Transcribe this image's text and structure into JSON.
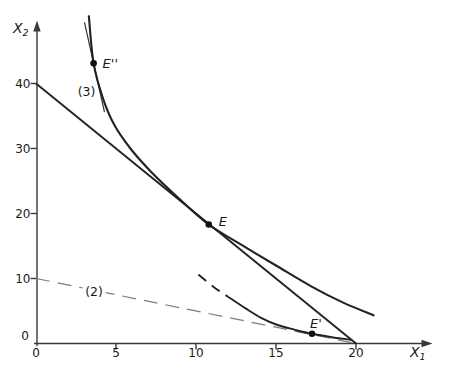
{
  "chart_data": {
    "type": "line",
    "title": "",
    "xlabel": {
      "base": "X",
      "sub": "1"
    },
    "ylabel": {
      "base": "X",
      "sub": "2"
    },
    "xlim": [
      0,
      24.5
    ],
    "ylim": [
      0,
      50.5
    ],
    "grid": false,
    "legend": "none",
    "x_ticks": [
      0,
      5,
      10,
      15,
      20
    ],
    "y_ticks": [
      0,
      10,
      20,
      30,
      40
    ],
    "style": {
      "background": "#ffffff",
      "axis_color": "#3a3a3a",
      "text_color": "#1a1a1a",
      "curve_color": "#222222",
      "tangent_color": "#333333",
      "dashed_line_color": "#7d7d7d",
      "point_color": "#111111"
    },
    "series": [
      {
        "name": "budget-line-1",
        "role": "price line tangent at E",
        "shape": "line",
        "dash": null,
        "width": 1.9,
        "color": "#222222",
        "points": [
          [
            0,
            40
          ],
          [
            20,
            0
          ]
        ]
      },
      {
        "name": "price-line-2",
        "role": "dashed price line tangent at E', labeled (2)",
        "shape": "line",
        "dash": "14,8",
        "width": 1.2,
        "color": "#7d7d7d",
        "points": [
          [
            0,
            10
          ],
          [
            20,
            0
          ]
        ]
      },
      {
        "name": "tangent-line-3",
        "role": "steep price line tangent at E'', labeled (3)",
        "shape": "line",
        "dash": null,
        "width": 1.2,
        "color": "#333333",
        "points": [
          [
            3.03,
            49.4
          ],
          [
            4.28,
            35.6
          ]
        ]
      },
      {
        "name": "indifference-curve-upper",
        "role": "indifference curve through E'' and E",
        "shape": "curve",
        "dash": null,
        "width": 2.1,
        "color": "#222222",
        "points": [
          [
            3.3,
            50.5
          ],
          [
            3.6,
            43.1
          ],
          [
            4.2,
            37.6
          ],
          [
            4.9,
            33.6
          ],
          [
            5.9,
            30.0
          ],
          [
            7.2,
            26.4
          ],
          [
            8.9,
            22.4
          ],
          [
            10.8,
            18.3
          ],
          [
            12.9,
            15.1
          ],
          [
            15.0,
            12.0
          ],
          [
            17.2,
            8.8
          ],
          [
            19.2,
            6.3
          ],
          [
            21.15,
            4.3
          ]
        ]
      },
      {
        "name": "indifference-curve-lower-dashed-segment",
        "role": "dashed upper end of lower indifference curve",
        "shape": "curve",
        "dash": "10,7",
        "width": 1.9,
        "color": "#222222",
        "points": [
          [
            10.15,
            10.6
          ],
          [
            11.1,
            8.7
          ],
          [
            12.0,
            7.2
          ]
        ]
      },
      {
        "name": "indifference-curve-lower",
        "role": "indifference curve through E'",
        "shape": "curve",
        "dash": null,
        "width": 1.9,
        "color": "#222222",
        "points": [
          [
            12.0,
            7.2
          ],
          [
            13.1,
            5.4
          ],
          [
            14.1,
            3.9
          ],
          [
            15.1,
            2.85
          ],
          [
            16.2,
            2.1
          ],
          [
            17.25,
            1.5
          ],
          [
            18.4,
            1.0
          ],
          [
            19.7,
            0.55
          ]
        ]
      }
    ],
    "points": [
      {
        "name": "E-double-prime",
        "label": "E''",
        "x": 3.6,
        "y": 43.1,
        "label_dx": 9,
        "label_dy": 4
      },
      {
        "name": "E",
        "label": "E",
        "x": 10.8,
        "y": 18.3,
        "label_dx": 10,
        "label_dy": 0
      },
      {
        "name": "E-prime",
        "label": "E'",
        "x": 17.25,
        "y": 1.5,
        "label_dx": -2,
        "label_dy": -7
      }
    ],
    "annotations": [
      {
        "name": "label-line-3",
        "text": "(3)",
        "x": 3.16,
        "y": 38.8,
        "halo": false
      },
      {
        "name": "label-line-2",
        "text": "(2)",
        "x": 3.63,
        "y": 7.97,
        "halo": true
      }
    ]
  }
}
